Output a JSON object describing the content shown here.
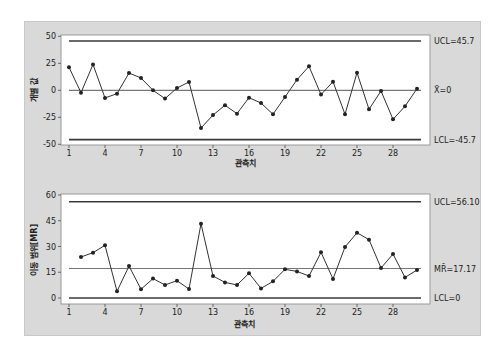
{
  "chart_data": [
    {
      "type": "line",
      "title": "",
      "xlabel": "관측치",
      "ylabel": "개별 값",
      "x": [
        1,
        2,
        3,
        4,
        5,
        6,
        7,
        8,
        9,
        10,
        11,
        12,
        13,
        14,
        15,
        16,
        17,
        18,
        19,
        20,
        21,
        22,
        23,
        24,
        25,
        26,
        27,
        28,
        29,
        30
      ],
      "x_ticks": [
        1,
        4,
        7,
        10,
        13,
        16,
        19,
        22,
        25,
        28
      ],
      "y_ticks": [
        50,
        25,
        0,
        -25,
        -50
      ],
      "ylim": [
        -50,
        50
      ],
      "grid": false,
      "series": [
        {
          "name": "개별 값",
          "values": [
            21.3,
            -2.2,
            24,
            -7.1,
            -3.1,
            16,
            11.4,
            0,
            -7.7,
            2.1,
            7.7,
            -34.9,
            -22.9,
            -13.9,
            -21.6,
            -6.8,
            -11.8,
            -22.2,
            -6.2,
            9.8,
            22.2,
            -4,
            8,
            -22.2,
            16.3,
            -17.6,
            -0.6,
            -26.9,
            -14.8,
            1.5
          ]
        }
      ],
      "control_lines": {
        "ucl": {
          "value": 45.7,
          "label": "UCL=45.7"
        },
        "center": {
          "value": 0,
          "label": "X̄=0"
        },
        "lcl": {
          "value": -45.7,
          "label": "LCL=-45.7"
        }
      }
    },
    {
      "type": "line",
      "title": "",
      "xlabel": "관측치",
      "ylabel": "이동 범위[MR]",
      "x": [
        2,
        3,
        4,
        5,
        6,
        7,
        8,
        9,
        10,
        11,
        12,
        13,
        14,
        15,
        16,
        17,
        18,
        19,
        20,
        21,
        22,
        23,
        24,
        25,
        26,
        27,
        28,
        29,
        30
      ],
      "x_ticks": [
        1,
        4,
        7,
        10,
        13,
        16,
        19,
        22,
        25,
        28
      ],
      "y_ticks": [
        60,
        45,
        30,
        15,
        0
      ],
      "ylim": [
        0,
        60
      ],
      "grid": false,
      "series": [
        {
          "name": "이동 범위",
          "values": [
            23.9,
            26.4,
            30.7,
            3.9,
            18.6,
            5.1,
            11.3,
            7.6,
            10.1,
            5.2,
            43.3,
            12.8,
            9.1,
            7.6,
            14.4,
            5.6,
            9.7,
            16.7,
            15.5,
            12.8,
            26.6,
            11.1,
            29.7,
            38,
            34,
            17.5,
            25.6,
            12,
            16.3
          ]
        }
      ],
      "control_lines": {
        "ucl": {
          "value": 56.1,
          "label": "UCL=56.10"
        },
        "center": {
          "value": 17.17,
          "label": "MR̄=17.17"
        },
        "lcl": {
          "value": 0,
          "label": "LCL=0"
        }
      }
    }
  ],
  "colors": {
    "panel_bg": "#d9d9d9",
    "plot_bg": "#ffffff",
    "line": "#333333",
    "limit_line": "#3a3a3a",
    "center_line": "#777777"
  }
}
